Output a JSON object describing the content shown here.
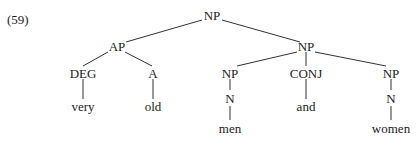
{
  "example_number": "(59)",
  "tree": {
    "root": "NP",
    "nodes": {
      "np_root": "NP",
      "ap": "AP",
      "deg": "DEG",
      "a": "A",
      "np_coord": "NP",
      "np_left": "NP",
      "conj": "CONJ",
      "np_right": "NP",
      "n_left": "N",
      "n_right": "N"
    },
    "words": {
      "very": "very",
      "old": "old",
      "men": "men",
      "and": "and",
      "women": "women"
    }
  }
}
